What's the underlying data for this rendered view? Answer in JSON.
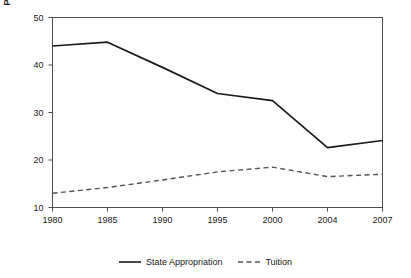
{
  "chart_data": {
    "type": "line",
    "title": "",
    "subtitle": "",
    "xlabel": "Year",
    "ylabel": "Percentage of Revenues",
    "categories": [
      "1980",
      "1985",
      "1990",
      "1995",
      "2000",
      "2004",
      "2007"
    ],
    "x_tick_labels": [
      "1980",
      "1985",
      "1990",
      "1995",
      "2000",
      "2004",
      "2007"
    ],
    "y_tick_labels": [
      "10",
      "20",
      "30",
      "40",
      "50"
    ],
    "y_ticks": [
      10,
      20,
      30,
      40,
      50
    ],
    "ylim": [
      10,
      50
    ],
    "grid": false,
    "legend_position": "bottom",
    "series": [
      {
        "name": "State Appropriation",
        "style": "solid",
        "color": "#1a1a1a",
        "values": [
          44.0,
          44.8,
          39.5,
          34.0,
          32.5,
          22.6,
          24.1
        ]
      },
      {
        "name": "Tuition",
        "style": "dashed",
        "color": "#555555",
        "values": [
          13.0,
          14.2,
          15.8,
          17.5,
          18.5,
          16.5,
          17.0
        ]
      }
    ]
  },
  "legend": {
    "items": [
      {
        "label": "State Appropriation",
        "style": "solid"
      },
      {
        "label": "Tuition",
        "style": "dashed"
      }
    ]
  },
  "colors": {
    "axis": "#4d4d4d",
    "series_solid": "#1a1a1a",
    "series_dashed": "#555555",
    "background": "#ffffff"
  }
}
